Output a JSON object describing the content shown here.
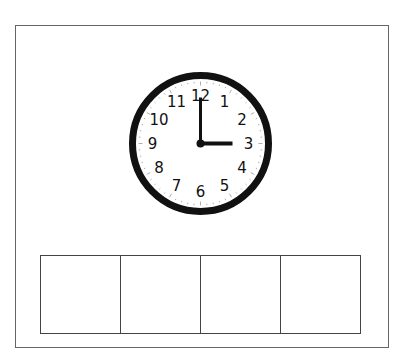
{
  "worksheet": {
    "clock": {
      "numerals": [
        "12",
        "1",
        "2",
        "3",
        "4",
        "5",
        "6",
        "7",
        "8",
        "9",
        "10",
        "11"
      ],
      "time": {
        "hour": 3,
        "minute": 0
      },
      "face_color": "#ffffff",
      "rim_color": "#111111"
    },
    "answer_boxes": [
      "",
      "",
      "",
      ""
    ]
  }
}
